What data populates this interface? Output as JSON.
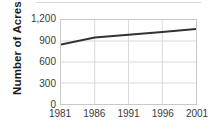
{
  "chart_data": {
    "type": "line",
    "title": "",
    "xlabel": "",
    "ylabel": "Number of Acres",
    "x": [
      1981,
      1986,
      1991,
      1996,
      2001
    ],
    "xtick_labels": [
      "1981",
      "1986",
      "1991",
      "1996",
      "2001"
    ],
    "xlim": [
      1981,
      2001
    ],
    "values": [
      850,
      950,
      990,
      1030,
      1070
    ],
    "series": [
      {
        "name": "Number of Acres",
        "values": [
          850,
          950,
          990,
          1030,
          1070
        ]
      }
    ],
    "ylim": [
      0,
      1200
    ],
    "yticks": [
      0,
      300,
      600,
      900,
      1200
    ],
    "ytick_labels": [
      "0",
      "300",
      "600",
      "900",
      "1,200"
    ],
    "grid": true,
    "legend": "none",
    "line_color": "#333333",
    "grid_color": "#d9d9d9",
    "axis_color": "#c9c9c9",
    "text_color": "#3a3a3a"
  }
}
